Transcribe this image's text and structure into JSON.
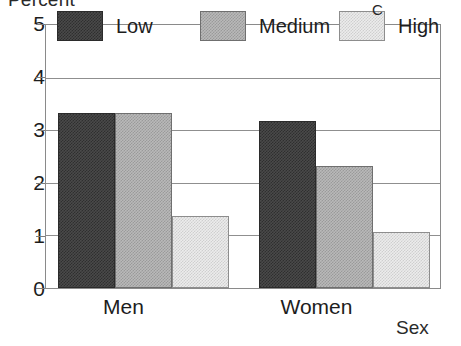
{
  "chart_data": {
    "type": "bar",
    "title": "",
    "xlabel": "Sex",
    "ylabel": "Percent",
    "categories": [
      "Men",
      "Women"
    ],
    "series": [
      {
        "name": "Low",
        "values": [
          3.32,
          3.17
        ]
      },
      {
        "name": "Medium",
        "values": [
          3.32,
          2.32
        ]
      },
      {
        "name": "High",
        "values": [
          1.37,
          1.07
        ]
      }
    ],
    "ylim": [
      0,
      5
    ],
    "yticks": [
      "0",
      "1",
      "2",
      "3",
      "4",
      "5"
    ],
    "grid": true,
    "legend_position": "inside-top",
    "annotations": [
      "C"
    ]
  },
  "axes": {
    "y_title": "Percent",
    "x_title": "Sex",
    "y_ticks": [
      "5",
      "4",
      "3",
      "2",
      "1",
      "0"
    ],
    "x_ticks": [
      "Men",
      "Women"
    ]
  },
  "legend": {
    "entries": [
      {
        "label": "Low",
        "swatch": "dark-gray-dither"
      },
      {
        "label": "Medium",
        "swatch": "medium-gray-dither"
      },
      {
        "label": "High",
        "swatch": "light-gray-dither"
      }
    ],
    "stray_mark": "C"
  },
  "colors": {
    "low": "#4a4a4a",
    "medium": "#b9b9b9",
    "high": "#ececec",
    "axis": "#8a8a8a",
    "text": "#1d1d1d",
    "background": "#ffffff"
  }
}
